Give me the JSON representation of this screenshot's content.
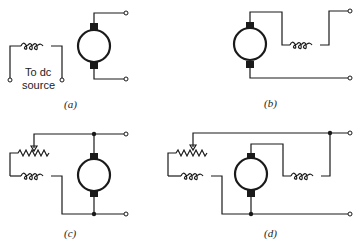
{
  "figure": {
    "panels": [
      {
        "id": "a",
        "label": "(a)",
        "description": "Separately excited: field coil to dc source, armature to terminals"
      },
      {
        "id": "b",
        "label": "(b)",
        "description": "Series: field coil in series with armature"
      },
      {
        "id": "c",
        "label": "(c)",
        "description": "Shunt: rheostat and field coil in parallel with armature"
      },
      {
        "id": "d",
        "label": "(d)",
        "description": "Compound: shunt field with rheostat plus series field"
      }
    ],
    "source_text_line1": "To dc",
    "source_text_line2": "source"
  },
  "colors": {
    "line": "#1a1a1a",
    "background": "#ffffff"
  }
}
